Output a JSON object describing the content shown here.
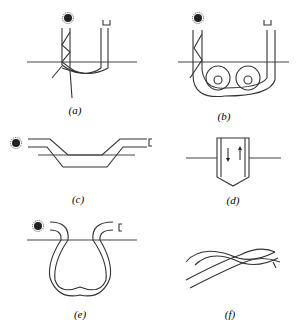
{
  "figure": {
    "panels": [
      {
        "id": "a",
        "label": "(a)",
        "shape": "U-bend with ray paths escaping"
      },
      {
        "id": "b",
        "label": "(b)",
        "shape": "U-bend with two loops"
      },
      {
        "id": "c",
        "label": "(c)",
        "shape": "trapezoidal dip bend"
      },
      {
        "id": "d",
        "label": "(d)",
        "shape": "probe with tapered tip, bidirectional arrows"
      },
      {
        "id": "e",
        "label": "(e)",
        "shape": "heart-shaped loop bend"
      },
      {
        "id": "f",
        "label": "(f)",
        "shape": "twisted fiber pair"
      }
    ],
    "icons": {
      "source": "light-source-icon",
      "detector": "detector-icon"
    }
  }
}
